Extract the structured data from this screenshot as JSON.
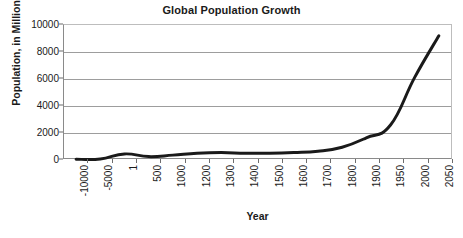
{
  "chart_data": {
    "type": "line",
    "title": "Global Population Growth",
    "xlabel": "Year",
    "ylabel": "Population, in Millions",
    "categories": [
      "-10000",
      "-5000",
      "1",
      "500",
      "1000",
      "1200",
      "1300",
      "1400",
      "1500",
      "1600",
      "1700",
      "1800",
      "1900",
      "1950",
      "2000",
      "2050"
    ],
    "values": [
      5,
      20,
      400,
      200,
      310,
      450,
      500,
      450,
      450,
      500,
      600,
      900,
      1600,
      2550,
      6100,
      9200
    ],
    "series": [
      {
        "name": "Global population",
        "values": [
          5,
          20,
          400,
          200,
          310,
          450,
          500,
          450,
          450,
          500,
          600,
          900,
          1600,
          2550,
          6100,
          9200
        ]
      }
    ],
    "ylim": [
      0,
      10000
    ],
    "y_ticks": [
      0,
      2000,
      4000,
      6000,
      8000,
      10000
    ],
    "y_tick_labels": [
      "0",
      "2000",
      "4000",
      "6000",
      "8000",
      "10000"
    ],
    "grid": "horizontal",
    "legend": "none",
    "line_color": "#1a1a1a",
    "line_width": 3,
    "x_tick_label_rotation": -90
  }
}
